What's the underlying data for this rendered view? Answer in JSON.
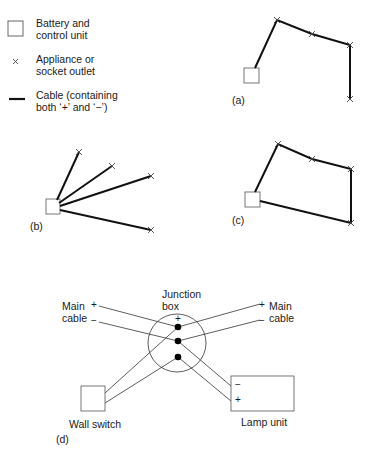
{
  "legend": {
    "items": [
      {
        "icon": "battery-control-unit-square",
        "label_line1": "Battery and",
        "label_line2": "control unit"
      },
      {
        "icon": "appliance-outlet-cross",
        "symbol": "×",
        "label_line1": "Appliance or",
        "label_line2": "socket outlet"
      },
      {
        "icon": "cable-line",
        "label_line1": "Cable (containing",
        "label_line2": "both ‘+’ and ‘−’)"
      }
    ]
  },
  "diagrams": {
    "a": {
      "label": "(a)",
      "topology": "daisy-chain (open)"
    },
    "b": {
      "label": "(b)",
      "topology": "radial"
    },
    "c": {
      "label": "(c)",
      "topology": "ring"
    },
    "d": {
      "label": "(d)",
      "junction_box": {
        "label_line1": "Junction",
        "label_line2": "box",
        "plus": "+"
      },
      "main_cable_left": {
        "label_line1": "Main",
        "label_line2": "cable",
        "plus": "+",
        "minus": "−"
      },
      "main_cable_right": {
        "label_line1": "Main",
        "label_line2": "cable",
        "plus": "+",
        "minus": "−"
      },
      "wall_switch": {
        "label": "Wall switch"
      },
      "lamp_unit": {
        "label": "Lamp unit",
        "minus": "−",
        "plus": "+"
      }
    }
  },
  "colors": {
    "line": "#1a1a1a",
    "thin_line": "#333333",
    "box": "#555555"
  }
}
